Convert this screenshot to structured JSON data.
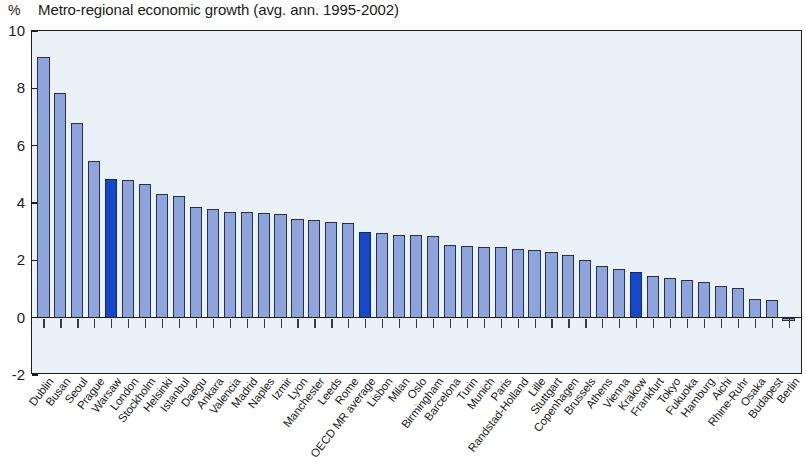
{
  "header": {
    "unit_symbol": "%",
    "title": "Metro-regional economic growth (avg. ann. 1995-2002)"
  },
  "colors": {
    "bar_fill": "#8fa3dd",
    "bar_highlight": "#1647c4",
    "bar_outline": "#2b2f49",
    "plot_background": "#e8f2f7",
    "axis": "#1c1c1c"
  },
  "chart_data": {
    "type": "bar",
    "title": "Metro-regional economic growth (avg. ann. 1995-2002)",
    "xlabel": "",
    "ylabel": "%",
    "ylim": [
      -2,
      10
    ],
    "yticks": [
      10,
      8,
      6,
      4,
      2,
      0,
      -2
    ],
    "ytick_labels": [
      "10",
      "8",
      "6",
      "4",
      "2",
      "0",
      "-2"
    ],
    "grid": false,
    "legend": "none",
    "highlighted_categories": [
      "Warsaw",
      "OECD MR average",
      "Krakow"
    ],
    "categories": [
      "Dublin",
      "Busan",
      "Seoul",
      "Prague",
      "Warsaw",
      "London",
      "Stockholm",
      "Helsinki",
      "Istanbul",
      "Daegu",
      "Ankara",
      "Valencia",
      "Madrid",
      "Naples",
      "Izmir",
      "Lyon",
      "Manchester",
      "Leeds",
      "Rome",
      "OECD MR average",
      "Lisbon",
      "Milan",
      "Oslo",
      "Birmingham",
      "Barcelona",
      "Turin",
      "Munich",
      "Paris",
      "Randstad-Holland",
      "Lille",
      "Stuttgart",
      "Copenhagen",
      "Brussels",
      "Athens",
      "Vienna",
      "Krakow",
      "Frankfurt",
      "Tokyo",
      "Fukuoka",
      "Hamburg",
      "Aichi",
      "Rhine-Ruhr",
      "Osaka",
      "Budapest",
      "Berlin"
    ],
    "values": [
      9.1,
      7.85,
      6.8,
      5.45,
      4.85,
      4.8,
      4.65,
      4.3,
      4.25,
      3.85,
      3.8,
      3.7,
      3.7,
      3.65,
      3.6,
      3.45,
      3.4,
      3.35,
      3.3,
      3.0,
      2.95,
      2.9,
      2.9,
      2.85,
      2.55,
      2.5,
      2.45,
      2.45,
      2.4,
      2.35,
      2.3,
      2.2,
      2.0,
      1.8,
      1.7,
      1.6,
      1.45,
      1.4,
      1.3,
      1.25,
      1.1,
      1.05,
      0.65,
      0.6,
      -0.1
    ]
  }
}
